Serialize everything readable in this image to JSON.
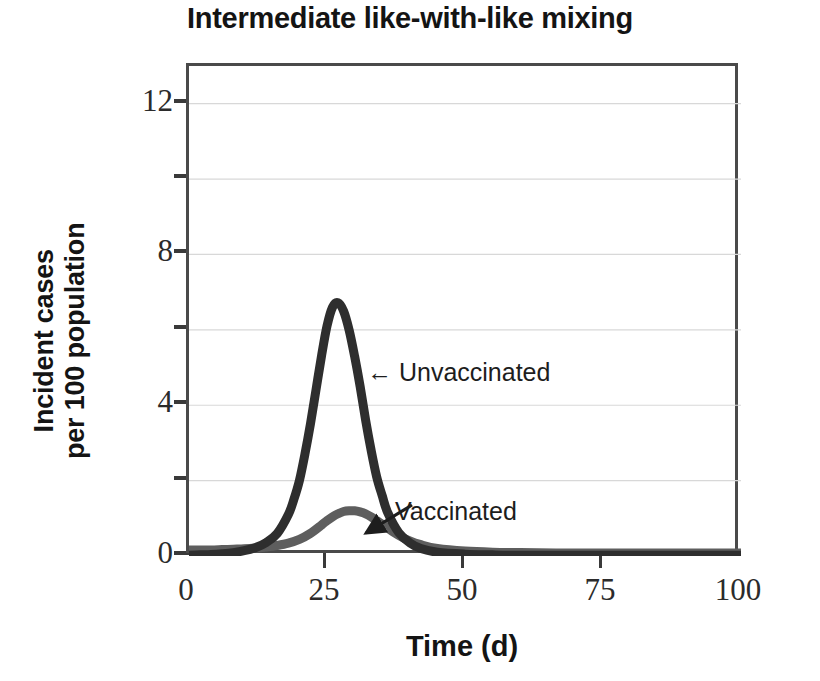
{
  "chart_data": {
    "type": "line",
    "title": "Intermediate like-with-like mixing",
    "xlabel": "Time (d)",
    "ylabel_line1": "Incident cases",
    "ylabel_line2": "per 100 population",
    "xlim": [
      0,
      100
    ],
    "ylim": [
      0,
      13
    ],
    "xticks": [
      0,
      25,
      50,
      75,
      100
    ],
    "xtick_labels": [
      "0",
      "25",
      "50",
      "75",
      "100"
    ],
    "yticks": [
      0,
      2,
      4,
      6,
      8,
      10,
      12
    ],
    "ytick_labels": [
      "0",
      "",
      "4",
      "",
      "8",
      "",
      "12"
    ],
    "grid": "horizontal-faint",
    "legend": "inline-annotations",
    "annotations": [
      {
        "text": "← Unvaccinated",
        "label": "Unvaccinated",
        "arrow": "left",
        "at_x": 27,
        "at_y": 5.0
      },
      {
        "text": "Vaccinated",
        "label": "Vaccinated",
        "arrow": "down-left",
        "at_x": 31,
        "at_y": 1.2
      }
    ],
    "series": [
      {
        "name": "Unvaccinated",
        "color": "#2e2e2e",
        "linewidth": 9,
        "peak_x": 27,
        "peak_y": 6.7,
        "x": [
          0,
          2,
          4,
          6,
          8,
          10,
          12,
          14,
          16,
          18,
          19,
          20,
          21,
          22,
          23,
          24,
          25,
          26,
          27,
          28,
          29,
          30,
          31,
          32,
          33,
          34,
          35,
          36,
          38,
          40,
          42,
          45,
          50,
          55,
          60,
          70,
          80,
          90,
          100
        ],
        "y": [
          0.02,
          0.03,
          0.04,
          0.06,
          0.09,
          0.14,
          0.22,
          0.36,
          0.6,
          1.1,
          1.5,
          2.0,
          2.7,
          3.5,
          4.4,
          5.3,
          6.1,
          6.6,
          6.72,
          6.5,
          6.0,
          5.3,
          4.5,
          3.6,
          2.8,
          2.1,
          1.6,
          1.15,
          0.62,
          0.35,
          0.2,
          0.1,
          0.05,
          0.03,
          0.02,
          0.02,
          0.02,
          0.02,
          0.02
        ]
      },
      {
        "name": "Vaccinated",
        "color": "#5e5e5e",
        "linewidth": 9,
        "peak_x": 30,
        "peak_y": 1.2,
        "x": [
          0,
          2,
          4,
          6,
          8,
          10,
          12,
          14,
          16,
          18,
          20,
          22,
          24,
          25,
          26,
          27,
          28,
          29,
          30,
          31,
          32,
          33,
          34,
          35,
          36,
          38,
          40,
          42,
          45,
          50,
          55,
          60,
          70,
          80,
          90,
          100
        ],
        "y": [
          0.16,
          0.16,
          0.16,
          0.17,
          0.18,
          0.19,
          0.21,
          0.24,
          0.28,
          0.34,
          0.44,
          0.6,
          0.82,
          0.94,
          1.04,
          1.12,
          1.18,
          1.2,
          1.2,
          1.17,
          1.12,
          1.04,
          0.94,
          0.84,
          0.74,
          0.55,
          0.4,
          0.3,
          0.2,
          0.13,
          0.1,
          0.09,
          0.08,
          0.08,
          0.08,
          0.08
        ]
      }
    ]
  },
  "colors": {
    "axis": "#4a4a4a",
    "grid": "#d8d8d8",
    "text": "#141414",
    "unvaccinated": "#2e2e2e",
    "vaccinated": "#5e5e5e",
    "background": "#ffffff"
  }
}
